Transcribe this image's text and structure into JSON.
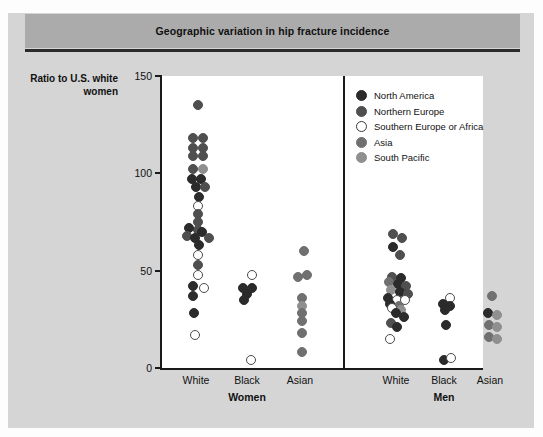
{
  "figure": {
    "title": "Geographic variation in hip fracture incidence",
    "background_color": "#d5d5d5",
    "title_band_color": "#ababab"
  },
  "chart_data": {
    "type": "scatter",
    "title": "Geographic variation in hip fracture incidence",
    "ylabel": "Ratio to U.S. white women",
    "xlabel": "",
    "ylim": [
      0,
      150
    ],
    "yticks": [
      0,
      50,
      100,
      150
    ],
    "grid": false,
    "legend_position": "top-right inside plot",
    "panels": [
      {
        "name": "Women",
        "categories": [
          "White",
          "Black",
          "Asian"
        ]
      },
      {
        "name": "Men",
        "categories": [
          "White",
          "Black",
          "Asian"
        ]
      }
    ],
    "series": [
      {
        "name": "North America",
        "color": "#2b2b2b"
      },
      {
        "name": "Northern Europe",
        "color": "#4f4f4f"
      },
      {
        "name": "Southern Europe or Africa",
        "color": "#ffffff"
      },
      {
        "name": "Asia",
        "color": "#707070"
      },
      {
        "name": "South Pacific",
        "color": "#8f8f8f"
      }
    ],
    "points": [
      {
        "panel": "Women",
        "category": "White",
        "value": 135,
        "group": "Northern Europe",
        "jitter": 0
      },
      {
        "panel": "Women",
        "category": "White",
        "value": 118,
        "group": "Northern Europe",
        "jitter": -5
      },
      {
        "panel": "Women",
        "category": "White",
        "value": 118,
        "group": "Northern Europe",
        "jitter": 5
      },
      {
        "panel": "Women",
        "category": "White",
        "value": 113,
        "group": "Northern Europe",
        "jitter": -5
      },
      {
        "panel": "Women",
        "category": "White",
        "value": 113,
        "group": "Northern Europe",
        "jitter": 5
      },
      {
        "panel": "Women",
        "category": "White",
        "value": 109,
        "group": "Northern Europe",
        "jitter": -5
      },
      {
        "panel": "Women",
        "category": "White",
        "value": 109,
        "group": "Northern Europe",
        "jitter": 5
      },
      {
        "panel": "Women",
        "category": "White",
        "value": 102,
        "group": "Northern Europe",
        "jitter": -5
      },
      {
        "panel": "Women",
        "category": "White",
        "value": 102,
        "group": "South Pacific",
        "jitter": 5
      },
      {
        "panel": "Women",
        "category": "White",
        "value": 97,
        "group": "North America",
        "jitter": -6
      },
      {
        "panel": "Women",
        "category": "White",
        "value": 97,
        "group": "North America",
        "jitter": 3
      },
      {
        "panel": "Women",
        "category": "White",
        "value": 93,
        "group": "North America",
        "jitter": -2
      },
      {
        "panel": "Women",
        "category": "White",
        "value": 93,
        "group": "Northern Europe",
        "jitter": 7
      },
      {
        "panel": "Women",
        "category": "White",
        "value": 88,
        "group": "North America",
        "jitter": 1
      },
      {
        "panel": "Women",
        "category": "White",
        "value": 83,
        "group": "Southern Europe or Africa",
        "jitter": 0
      },
      {
        "panel": "Women",
        "category": "White",
        "value": 79,
        "group": "Northern Europe",
        "jitter": 0
      },
      {
        "panel": "Women",
        "category": "White",
        "value": 75,
        "group": "Northern Europe",
        "jitter": 0
      },
      {
        "panel": "Women",
        "category": "White",
        "value": 71,
        "group": "Northern Europe",
        "jitter": 0
      },
      {
        "panel": "Women",
        "category": "White",
        "value": 72,
        "group": "North America",
        "jitter": -9
      },
      {
        "panel": "Women",
        "category": "White",
        "value": 68,
        "group": "Northern Europe",
        "jitter": -11
      },
      {
        "panel": "Women",
        "category": "White",
        "value": 67,
        "group": "North America",
        "jitter": -3
      },
      {
        "panel": "Women",
        "category": "White",
        "value": 70,
        "group": "North America",
        "jitter": 4
      },
      {
        "panel": "Women",
        "category": "White",
        "value": 67,
        "group": "Northern Europe",
        "jitter": 11
      },
      {
        "panel": "Women",
        "category": "White",
        "value": 63,
        "group": "North America",
        "jitter": 1
      },
      {
        "panel": "Women",
        "category": "White",
        "value": 58,
        "group": "Southern Europe or Africa",
        "jitter": 0
      },
      {
        "panel": "Women",
        "category": "White",
        "value": 53,
        "group": "Northern Europe",
        "jitter": 0
      },
      {
        "panel": "Women",
        "category": "White",
        "value": 48,
        "group": "Southern Europe or Africa",
        "jitter": 0
      },
      {
        "panel": "Women",
        "category": "White",
        "value": 42,
        "group": "North America",
        "jitter": -5
      },
      {
        "panel": "Women",
        "category": "White",
        "value": 41,
        "group": "Southern Europe or Africa",
        "jitter": 6
      },
      {
        "panel": "Women",
        "category": "White",
        "value": 37,
        "group": "North America",
        "jitter": -5
      },
      {
        "panel": "Women",
        "category": "White",
        "value": 28,
        "group": "North America",
        "jitter": -4
      },
      {
        "panel": "Women",
        "category": "White",
        "value": 17,
        "group": "Southern Europe or Africa",
        "jitter": -3
      },
      {
        "panel": "Women",
        "category": "Black",
        "value": 48,
        "group": "Southern Europe or Africa",
        "jitter": 3
      },
      {
        "panel": "Women",
        "category": "Black",
        "value": 41,
        "group": "North America",
        "jitter": -6
      },
      {
        "panel": "Women",
        "category": "Black",
        "value": 41,
        "group": "North America",
        "jitter": 3
      },
      {
        "panel": "Women",
        "category": "Black",
        "value": 38,
        "group": "North America",
        "jitter": -2
      },
      {
        "panel": "Women",
        "category": "Black",
        "value": 35,
        "group": "North America",
        "jitter": -5
      },
      {
        "panel": "Women",
        "category": "Black",
        "value": 4,
        "group": "Southern Europe or Africa",
        "jitter": 2
      },
      {
        "panel": "Women",
        "category": "Asian",
        "value": 60,
        "group": "Asia",
        "jitter": 2
      },
      {
        "panel": "Women",
        "category": "Asian",
        "value": 47,
        "group": "Asia",
        "jitter": -4
      },
      {
        "panel": "Women",
        "category": "Asian",
        "value": 48,
        "group": "Asia",
        "jitter": 5
      },
      {
        "panel": "Women",
        "category": "Asian",
        "value": 36,
        "group": "Asia",
        "jitter": 0
      },
      {
        "panel": "Women",
        "category": "Asian",
        "value": 32,
        "group": "South Pacific",
        "jitter": 0
      },
      {
        "panel": "Women",
        "category": "Asian",
        "value": 28,
        "group": "Asia",
        "jitter": 0
      },
      {
        "panel": "Women",
        "category": "Asian",
        "value": 24,
        "group": "Asia",
        "jitter": 0
      },
      {
        "panel": "Women",
        "category": "Asian",
        "value": 18,
        "group": "Asia",
        "jitter": 0
      },
      {
        "panel": "Women",
        "category": "Asian",
        "value": 8,
        "group": "Asia",
        "jitter": 0
      },
      {
        "panel": "Men",
        "category": "White",
        "value": 69,
        "group": "Northern Europe",
        "jitter": -5
      },
      {
        "panel": "Men",
        "category": "White",
        "value": 67,
        "group": "Northern Europe",
        "jitter": 4
      },
      {
        "panel": "Men",
        "category": "White",
        "value": 62,
        "group": "North America",
        "jitter": -5
      },
      {
        "panel": "Men",
        "category": "White",
        "value": 58,
        "group": "Northern Europe",
        "jitter": 2
      },
      {
        "panel": "Men",
        "category": "White",
        "value": 47,
        "group": "Northern Europe",
        "jitter": -6
      },
      {
        "panel": "Men",
        "category": "White",
        "value": 46,
        "group": "North America",
        "jitter": 3
      },
      {
        "panel": "Men",
        "category": "White",
        "value": 44,
        "group": "Asia",
        "jitter": -9
      },
      {
        "panel": "Men",
        "category": "White",
        "value": 43,
        "group": "North America",
        "jitter": 0
      },
      {
        "panel": "Men",
        "category": "White",
        "value": 42,
        "group": "Northern Europe",
        "jitter": 8
      },
      {
        "panel": "Men",
        "category": "White",
        "value": 40,
        "group": "South Pacific",
        "jitter": -7
      },
      {
        "panel": "Men",
        "category": "White",
        "value": 39,
        "group": "North America",
        "jitter": 2
      },
      {
        "panel": "Men",
        "category": "White",
        "value": 38,
        "group": "Northern Europe",
        "jitter": 10
      },
      {
        "panel": "Men",
        "category": "White",
        "value": 36,
        "group": "North America",
        "jitter": -10
      },
      {
        "panel": "Men",
        "category": "White",
        "value": 35,
        "group": "Southern Europe or Africa",
        "jitter": -1
      },
      {
        "panel": "Men",
        "category": "White",
        "value": 35,
        "group": "Southern Europe or Africa",
        "jitter": 7
      },
      {
        "panel": "Men",
        "category": "White",
        "value": 33,
        "group": "North America",
        "jitter": -8
      },
      {
        "panel": "Men",
        "category": "White",
        "value": 32,
        "group": "Asia",
        "jitter": 1
      },
      {
        "panel": "Men",
        "category": "White",
        "value": 31,
        "group": "Southern Europe or Africa",
        "jitter": -6
      },
      {
        "panel": "Men",
        "category": "White",
        "value": 30,
        "group": "South Pacific",
        "jitter": 3
      },
      {
        "panel": "Men",
        "category": "White",
        "value": 28,
        "group": "North America",
        "jitter": -2
      },
      {
        "panel": "Men",
        "category": "White",
        "value": 26,
        "group": "North America",
        "jitter": 6
      },
      {
        "panel": "Men",
        "category": "White",
        "value": 23,
        "group": "Northern Europe",
        "jitter": -7
      },
      {
        "panel": "Men",
        "category": "White",
        "value": 21,
        "group": "North America",
        "jitter": -1
      },
      {
        "panel": "Men",
        "category": "White",
        "value": 15,
        "group": "Southern Europe or Africa",
        "jitter": -8
      },
      {
        "panel": "Men",
        "category": "Black",
        "value": 36,
        "group": "Southern Europe or Africa",
        "jitter": 4
      },
      {
        "panel": "Men",
        "category": "Black",
        "value": 33,
        "group": "North America",
        "jitter": -3
      },
      {
        "panel": "Men",
        "category": "Black",
        "value": 32,
        "group": "North America",
        "jitter": 4
      },
      {
        "panel": "Men",
        "category": "Black",
        "value": 30,
        "group": "North America",
        "jitter": -1
      },
      {
        "panel": "Men",
        "category": "Black",
        "value": 22,
        "group": "North America",
        "jitter": 0
      },
      {
        "panel": "Men",
        "category": "Black",
        "value": 4,
        "group": "North America",
        "jitter": -2
      },
      {
        "panel": "Men",
        "category": "Black",
        "value": 5,
        "group": "Southern Europe or Africa",
        "jitter": 5
      },
      {
        "panel": "Men",
        "category": "Asian",
        "value": 37,
        "group": "Asia",
        "jitter": 0
      },
      {
        "panel": "Men",
        "category": "Asian",
        "value": 28,
        "group": "North America",
        "jitter": -4
      },
      {
        "panel": "Men",
        "category": "Asian",
        "value": 27,
        "group": "South Pacific",
        "jitter": 5
      },
      {
        "panel": "Men",
        "category": "Asian",
        "value": 22,
        "group": "Asia",
        "jitter": -3
      },
      {
        "panel": "Men",
        "category": "Asian",
        "value": 21,
        "group": "South Pacific",
        "jitter": 5
      },
      {
        "panel": "Men",
        "category": "Asian",
        "value": 16,
        "group": "Asia",
        "jitter": -3
      },
      {
        "panel": "Men",
        "category": "Asian",
        "value": 15,
        "group": "South Pacific",
        "jitter": 5
      }
    ]
  },
  "legend": {
    "items": [
      {
        "label": "North America",
        "color": "#2b2b2b",
        "open": false
      },
      {
        "label": "Northern Europe",
        "color": "#4f4f4f",
        "open": false
      },
      {
        "label": "Southern Europe or Africa",
        "color": "#ffffff",
        "open": true
      },
      {
        "label": "Asia",
        "color": "#707070",
        "open": false
      },
      {
        "label": "South Pacific",
        "color": "#8f8f8f",
        "open": false
      }
    ]
  },
  "axes": {
    "y_title_line1": "Ratio to U.S. white",
    "y_title_line2": "women",
    "y_ticks": [
      "150",
      "100",
      "50",
      "0"
    ],
    "x_labels": [
      "White",
      "Black",
      "Asian",
      "White",
      "Black",
      "Asian"
    ],
    "group_labels": [
      "Women",
      "Men"
    ]
  }
}
